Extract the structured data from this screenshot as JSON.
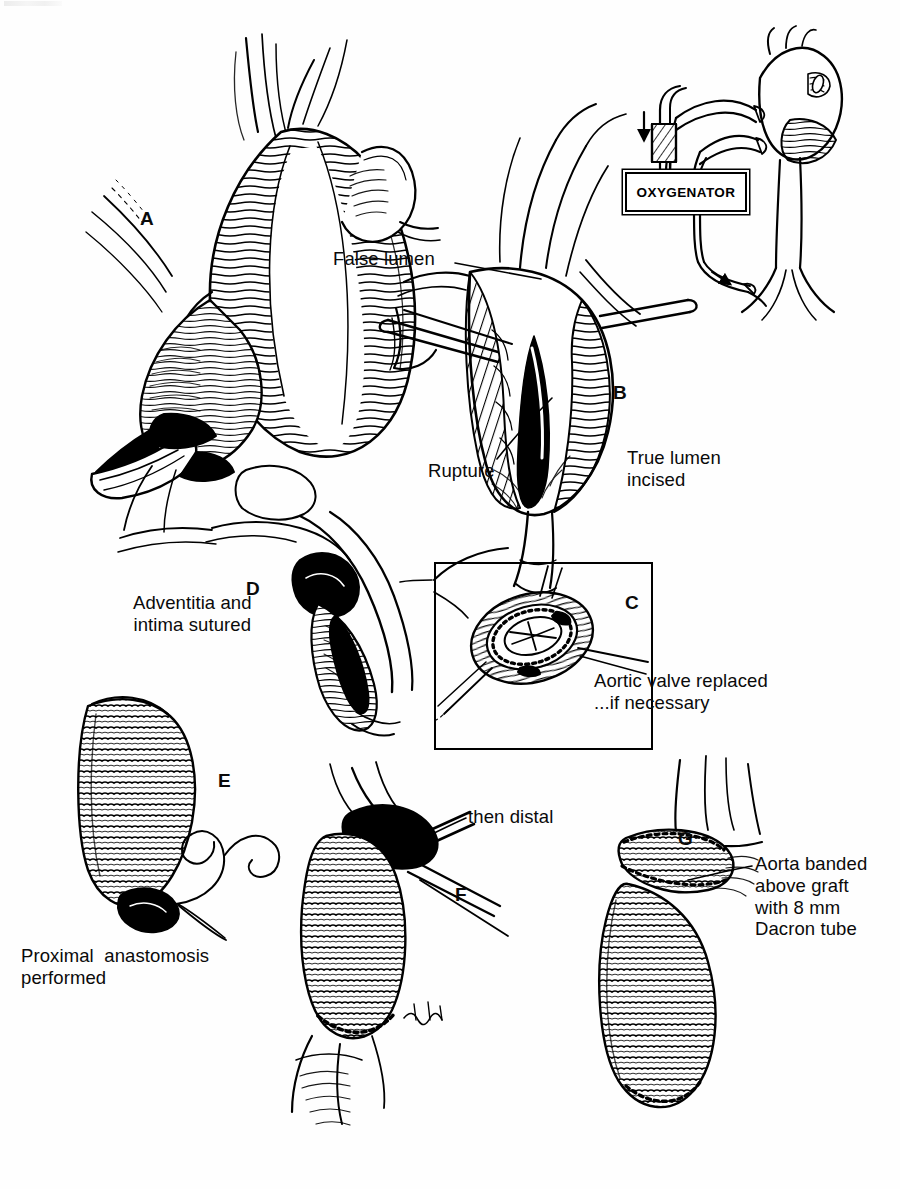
{
  "figure": {
    "style": "black-and-white pen-and-ink medical line illustration",
    "ink_color": "#000000",
    "background_color": "#ffffff"
  },
  "panels": [
    {
      "letter": "A",
      "name": "ascending-aortic-aneurysm",
      "description": "Exposed fusiform aneurysm of the ascending aorta with aortic root and valve below",
      "letter_x": 140,
      "letter_y": 208
    },
    {
      "letter": "B",
      "name": "aorta-opened-dissection",
      "description": "Aorta opened longitudinally showing dissection flap, false lumen and rupture site",
      "letter_x": 613,
      "letter_y": 382
    },
    {
      "letter": "C",
      "name": "aortic-valve-prosthesis-inset",
      "description": "Inset: prosthetic aortic valve sewn in place with stay sutures",
      "letter_x": 625,
      "letter_y": 592
    },
    {
      "letter": "D",
      "name": "adventitia-intima-sutured",
      "description": "Aortic wall layers re-approximated, adventitia and intima sutured together",
      "letter_x": 246,
      "letter_y": 578
    },
    {
      "letter": "E",
      "name": "proximal-anastomosis",
      "description": "Corrugated Dacron tube graft sutured proximally to the aortic root",
      "letter_x": 218,
      "letter_y": 770
    },
    {
      "letter": "F",
      "name": "distal-anastomosis",
      "description": "Graft sutured distally, completing the interposition tube graft",
      "letter_x": 455,
      "letter_y": 884
    },
    {
      "letter": "G",
      "name": "aorta-banded-above-graft",
      "description": "Native aorta banded above the graft with a Dacron band",
      "letter_x": 678,
      "letter_y": 828
    }
  ],
  "labels": [
    {
      "name": "false-lumen-label",
      "text": "False lumen",
      "x": 333,
      "y": 248,
      "align": "left",
      "leader_from": [
        455,
        263
      ],
      "leader_to": [
        540,
        278
      ]
    },
    {
      "name": "rupture-label",
      "text": "Rupture",
      "x": 428,
      "y": 460,
      "align": "left",
      "leader_from": [
        497,
        459
      ],
      "leader_to": [
        552,
        398
      ]
    },
    {
      "name": "true-lumen-incised-label",
      "text": "True lumen\nincised",
      "x": 627,
      "y": 447,
      "align": "left",
      "leader_from": null,
      "leader_to": null
    },
    {
      "name": "aortic-valve-replaced-label",
      "text": "Aortic valve replaced\n...if necessary",
      "x": 594,
      "y": 670,
      "align": "left",
      "leader_from": null,
      "leader_to": null
    },
    {
      "name": "adventitia-intima-sutured-label",
      "text": "Adventitia and\nintima sutured",
      "x": 133,
      "y": 592,
      "align": "left",
      "leader_from": null,
      "leader_to": null
    },
    {
      "name": "proximal-anastomosis-label",
      "text": "Proximal  anastomosis\nperformed",
      "x": 21,
      "y": 945,
      "align": "left",
      "leader_from": [
        225,
        938
      ],
      "leader_to": [
        178,
        905
      ]
    },
    {
      "name": "then-distal-label",
      "text": "then distal",
      "x": 468,
      "y": 806,
      "align": "left",
      "leader_from": [
        466,
        818
      ],
      "leader_to": [
        408,
        846
      ]
    },
    {
      "name": "aorta-banded-label",
      "text": "Aorta banded\nabove graft\nwith 8 mm\nDacron tube",
      "x": 755,
      "y": 853,
      "align": "left",
      "leader_from": [
        752,
        866
      ],
      "leader_to": [
        688,
        880
      ]
    }
  ],
  "bypass_circuit": {
    "name": "cardiopulmonary-bypass-diagram",
    "oxygenator_label": "OXYGENATOR",
    "oxygenator_box": {
      "x": 625,
      "y": 172,
      "width": 118,
      "height": 36
    },
    "components": [
      {
        "name": "heart",
        "description": "schematic heart with great vessels"
      },
      {
        "name": "pump",
        "description": "hatched roller pump block in arterial line"
      },
      {
        "name": "venous-cannula",
        "description": "cannula draining to oxygenator"
      },
      {
        "name": "arterial-cannula",
        "description": "return line to femoral artery"
      },
      {
        "name": "flow-arrow-down-left",
        "description": "downward flow arrow into pump"
      },
      {
        "name": "flow-arrow-down-right",
        "description": "downward flow arrow into oxygenator"
      },
      {
        "name": "flow-arrow-return",
        "description": "arrow indicating arterial return"
      }
    ]
  },
  "inset_frame": {
    "x": 434,
    "y": 562,
    "width": 215,
    "height": 184
  }
}
